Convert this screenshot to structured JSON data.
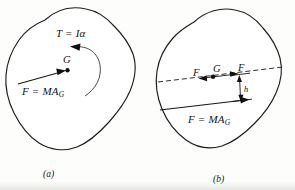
{
  "figure": {
    "type": "mechanics-free-body-diagram",
    "background_color": "#fdfdfb",
    "ink_color": "#151515",
    "panels": [
      {
        "id": "a",
        "caption": "(a)",
        "labels": {
          "torque": "T = Iα",
          "center_of_mass": "G",
          "force_resultant": "F = MA",
          "force_resultant_sub": "G"
        }
      },
      {
        "id": "b",
        "caption": "(b)",
        "labels": {
          "force_left": "F",
          "center_of_mass": "G",
          "force_right": "F",
          "moment_arm": "h",
          "force_resultant": "F = MA",
          "force_resultant_sub": "G"
        }
      }
    ]
  }
}
